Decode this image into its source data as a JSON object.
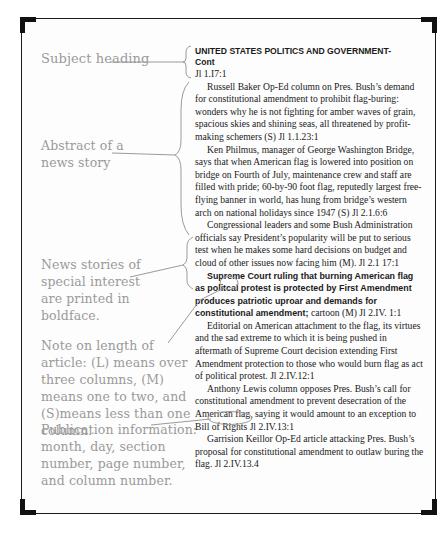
{
  "labels": {
    "subject_heading": "Subject heading",
    "abstract": "Abstract of a news story",
    "boldface_note": "News stories of special interest are printed in boldface.",
    "length_note": "Note on length of article: (L) means over three columns, (M) means one to two, and (S)means less than one column.",
    "publication_info": "Publication information: month, day, section number, page number, and column number."
  },
  "index": {
    "heading_line1": "UNITED STATES POLITICS AND GOVERNMENT-",
    "heading_line2": "Cont",
    "heading_ref": "Jl 1.I7:1",
    "entries": [
      {
        "text": "Russell Baker Op-Ed column on Pres. Bush’s demand for constitutional amendment to prohibit flag-buring: wonders why he is not fighting for amber waves of grain, spacious skies and shining seas, all threatened by profit-making schemers (S) Jl 1.1.23:1",
        "bold": false
      },
      {
        "text": "Ken Philmus, manager of George Washington Bridge, says that when American flag is lowered into position on bridge on Fourth of July, maintenance crew and staff are filled with pride; 60-by-90 foot flag, reputedly largest free-flying banner in world, has hung from bridge’s western arch on national holidays since 1947 (S) Jl 2.1.6:6",
        "bold": false
      },
      {
        "text": "Congressional leaders and some Bush Administration officials say President’s popularity will be put to serious test when he makes some hard decisions on budget and cloud of other issues now facing him (M). Jl 2.1 17:1",
        "bold": false
      },
      {
        "text": "Supreme Court ruling that burning American flag as politcal protest is protected by First Amendment produces patriotic uproar and demands for constitutional amendment;",
        "bold": true,
        "citation": "cartoon (M) Jl 2.IV. 1:1"
      },
      {
        "text": "Editorial on American attachment to the flag, its virtues and the sad extreme to which it is being pushed in aftermath of Supreme Court decision extending First Amendment protection to those who would burn flag as act of political protest. Jl 2.IV.12:1",
        "bold": false
      },
      {
        "text": "Anthony Lewis column opposes Pres. Bush’s call for constitutional amendment to prevent desecration of the American flag, saying it would amount to an exception to Bill of Rights Jl 2.IV.13:1",
        "bold": false
      },
      {
        "text": "Garrision Keillor Op-Ed article attacking Pres. Bush’s proposal for constitutional amendment to outlaw buring the flag. Jl 2.IV.13.4",
        "bold": false
      }
    ]
  },
  "colors": {
    "label_text": "#9a9a9a",
    "body_text": "#1a1a1a",
    "leader_lines": "#9a9a9a",
    "frame": "#111111"
  }
}
